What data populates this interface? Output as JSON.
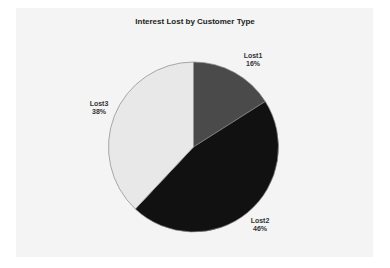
{
  "chart_data": {
    "type": "pie",
    "title": "Interest Lost by Customer Type",
    "categories": [
      "Lost1",
      "Lost2",
      "Lost3"
    ],
    "values": [
      16,
      46,
      38
    ],
    "labels": [
      "16%",
      "46%",
      "38%"
    ],
    "colors": [
      "#4a4a4a",
      "#111111",
      "#e8e8e8"
    ],
    "start_angle": "12 o'clock, clockwise",
    "legend": "none (data labels on slices)"
  }
}
